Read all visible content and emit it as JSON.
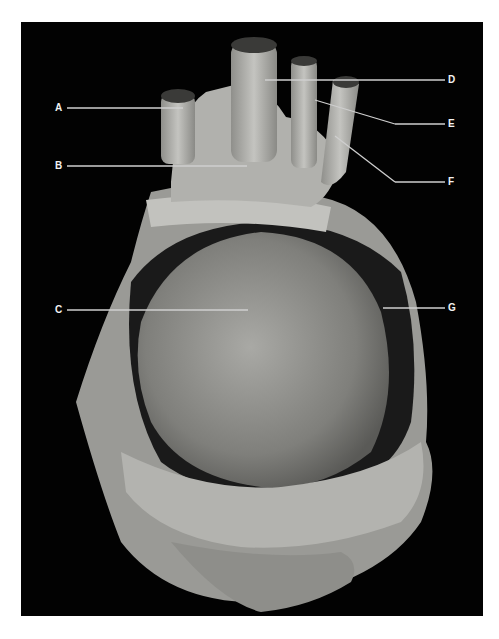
{
  "figure": {
    "background_color": "#020202",
    "tissue_color": "#b9b9b5",
    "leader_color": "#cfcfcf"
  },
  "labels": [
    {
      "id": "A",
      "text": "A",
      "side": "left"
    },
    {
      "id": "B",
      "text": "B",
      "side": "left"
    },
    {
      "id": "C",
      "text": "C",
      "side": "left"
    },
    {
      "id": "D",
      "text": "D",
      "side": "right"
    },
    {
      "id": "E",
      "text": "E",
      "side": "right"
    },
    {
      "id": "F",
      "text": "F",
      "side": "right"
    },
    {
      "id": "G",
      "text": "G",
      "side": "right"
    }
  ]
}
